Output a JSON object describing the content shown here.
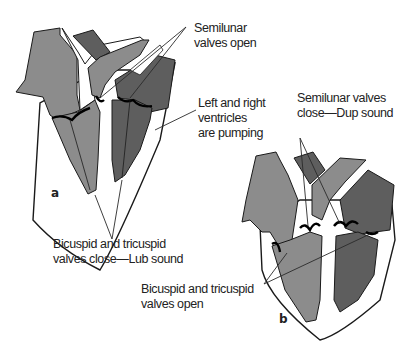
{
  "figure": {
    "panels": [
      {
        "id": "a",
        "letter": "a",
        "labels": {
          "semilunar": [
            "Semilunar",
            "valves open"
          ],
          "ventricles": [
            "Left and right",
            "ventricles",
            "are pumping"
          ],
          "av_valves": [
            "Bicuspid and tricuspid",
            "valves close—Lub sound"
          ]
        }
      },
      {
        "id": "b",
        "letter": "b",
        "labels": {
          "semilunar": [
            "Semilunar valves",
            "close—Dup sound"
          ],
          "av_valves": [
            "Bicuspid and tricuspid",
            "valves open"
          ]
        }
      }
    ],
    "colors": {
      "light_gray": "#8c8c8c",
      "dark_gray": "#5e5e5e",
      "outline": "#1a1a1a",
      "background": "#ffffff"
    }
  }
}
